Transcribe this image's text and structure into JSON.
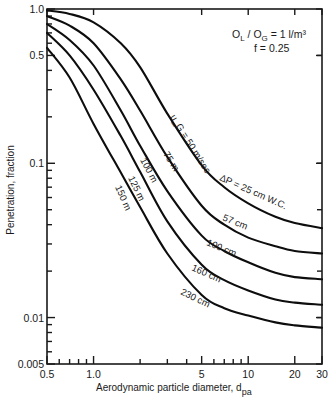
{
  "chart_data": {
    "type": "line",
    "title": "",
    "xlabel": "Aerodynamic particle diameter, d",
    "xlabel_sub": "pa",
    "ylabel": "Penetration, fraction",
    "xscale": "log",
    "yscale": "log",
    "xlim": [
      0.5,
      30
    ],
    "ylim": [
      0.005,
      1.0
    ],
    "grid": false,
    "x_ticks": [
      {
        "value": 0.5,
        "label": "0.5"
      },
      {
        "value": 1.0,
        "label": "1.0"
      },
      {
        "value": 5,
        "label": "5"
      },
      {
        "value": 10,
        "label": "10"
      },
      {
        "value": 20,
        "label": "20"
      },
      {
        "value": 30,
        "label": "30"
      }
    ],
    "x_minor_ticks": [
      0.6,
      0.7,
      0.8,
      0.9,
      2,
      3,
      4,
      6,
      7,
      8,
      9
    ],
    "y_ticks": [
      {
        "value": 1.0,
        "label": "1.0"
      },
      {
        "value": 0.5,
        "label": "0.5"
      },
      {
        "value": 0.1,
        "label": "0.1"
      },
      {
        "value": 0.01,
        "label": "0.01"
      },
      {
        "value": 0.005,
        "label": "0.005"
      }
    ],
    "y_minor_ticks": [
      0.9,
      0.8,
      0.7,
      0.6,
      0.4,
      0.3,
      0.2,
      0.09,
      0.08,
      0.07,
      0.06,
      0.05,
      0.04,
      0.03,
      0.02,
      0.009,
      0.008,
      0.007,
      0.006
    ],
    "annotations": {
      "ratio_line": "O_L / O_G = 1 l/m³",
      "ratio_main_L": "O",
      "ratio_sub_L": "L",
      "ratio_sep": " / O",
      "ratio_sub_G": "G",
      "ratio_tail": " = 1 l/m³",
      "f_line": "f = 0.25"
    },
    "x": [
      0.5,
      0.7,
      1.0,
      1.5,
      2.0,
      3.0,
      5.0,
      7.0,
      10.0,
      15.0,
      20.0,
      30.0
    ],
    "series": [
      {
        "name": "u_G = 50 m/sec, ΔP = 25 cm W.C.",
        "velocity_label": "u_G = 50 m/sec",
        "dp_label": "ΔP = 25 cm W.C.",
        "values": [
          0.98,
          0.93,
          0.82,
          0.6,
          0.42,
          0.21,
          0.097,
          0.07,
          0.055,
          0.045,
          0.041,
          0.038
        ]
      },
      {
        "name": "75 m, 57 cm",
        "velocity_label": "75 m",
        "dp_label": "57 cm",
        "values": [
          0.9,
          0.78,
          0.6,
          0.35,
          0.22,
          0.11,
          0.053,
          0.04,
          0.033,
          0.029,
          0.027,
          0.026
        ]
      },
      {
        "name": "100 m, 100 cm",
        "velocity_label": "100 m",
        "dp_label": "100 cm",
        "values": [
          0.8,
          0.63,
          0.43,
          0.22,
          0.13,
          0.066,
          0.034,
          0.027,
          0.0228,
          0.0195,
          0.0183,
          0.0177
        ]
      },
      {
        "name": "125 m, 160 cm",
        "velocity_label": "125 m",
        "dp_label": "160 cm",
        "values": [
          0.7,
          0.5,
          0.3,
          0.15,
          0.088,
          0.042,
          0.022,
          0.0175,
          0.015,
          0.0131,
          0.0125,
          0.0121
        ]
      },
      {
        "name": "150 m, 230 cm",
        "velocity_label": "150 m",
        "dp_label": "230 cm",
        "values": [
          0.56,
          0.36,
          0.18,
          0.087,
          0.052,
          0.026,
          0.014,
          0.0115,
          0.0103,
          0.0093,
          0.0089,
          0.0086
        ]
      }
    ]
  }
}
